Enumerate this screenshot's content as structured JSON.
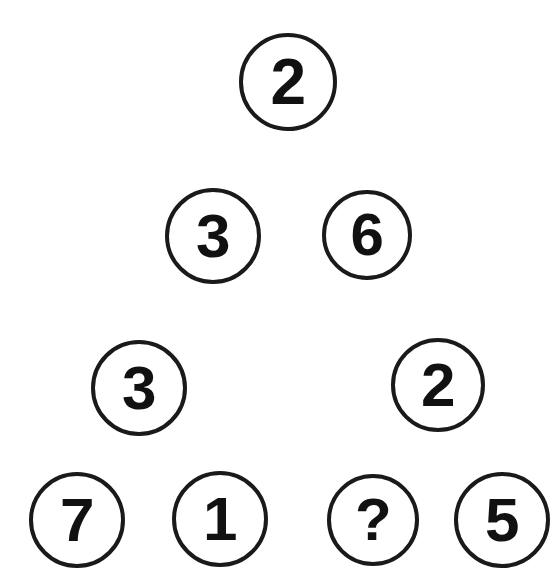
{
  "puzzle": {
    "title": "Number Pyramid Puzzle",
    "type": "number-circle-pyramid",
    "background_color": "#ffffff",
    "circle_stroke_color": "#1a1a1a",
    "digit_color": "#111111",
    "unknown_marker": "?",
    "rows": [
      {
        "row_index": 1,
        "nodes": [
          {
            "value": "2",
            "cx": 288,
            "cy": 82,
            "r": 49,
            "stroke": 4,
            "font_size": 64
          }
        ]
      },
      {
        "row_index": 2,
        "nodes": [
          {
            "value": "3",
            "cx": 213,
            "cy": 236,
            "r": 48,
            "stroke": 4,
            "font_size": 62
          },
          {
            "value": "6",
            "cx": 367,
            "cy": 235,
            "r": 45,
            "stroke": 4,
            "font_size": 60
          }
        ]
      },
      {
        "row_index": 3,
        "nodes": [
          {
            "value": "3",
            "cx": 139,
            "cy": 388,
            "r": 48,
            "stroke": 4,
            "font_size": 62
          },
          {
            "value": "2",
            "cx": 438,
            "cy": 385,
            "r": 47,
            "stroke": 4,
            "font_size": 62
          }
        ]
      },
      {
        "row_index": 4,
        "nodes": [
          {
            "value": "7",
            "cx": 77,
            "cy": 520,
            "r": 48,
            "stroke": 4,
            "font_size": 62
          },
          {
            "value": "1",
            "cx": 220,
            "cy": 519,
            "r": 48,
            "stroke": 4,
            "font_size": 62
          },
          {
            "value": "?",
            "cx": 373,
            "cy": 520,
            "r": 46,
            "stroke": 4,
            "font_size": 60
          },
          {
            "value": "5",
            "cx": 502,
            "cy": 520,
            "r": 48,
            "stroke": 4,
            "font_size": 62
          }
        ]
      }
    ]
  }
}
